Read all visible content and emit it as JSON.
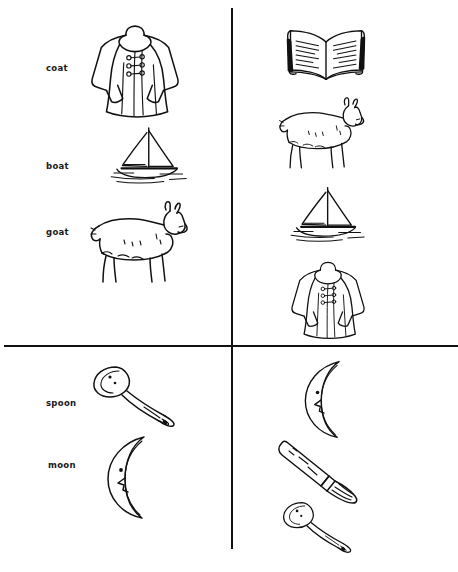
{
  "worksheet": {
    "title": "Rhyming / matching picture worksheet",
    "layout": "four-quadrant grid divided by one vertical and one horizontal rule",
    "ink_color": "#111111",
    "paper_color": "#ffffff"
  },
  "dividers": [
    {
      "name": "vertical-divider",
      "orientation": "vertical"
    },
    {
      "name": "horizontal-divider",
      "orientation": "horizontal"
    }
  ],
  "quadrants": {
    "top_left": {
      "name": "top-left-quadrant",
      "has_labels": true,
      "labels": [
        {
          "text": "coat",
          "x": 46,
          "y": 63
        },
        {
          "text": "boat",
          "x": 46,
          "y": 161
        },
        {
          "text": "goat",
          "x": 46,
          "y": 227
        }
      ],
      "pictures": [
        {
          "icon": "coat-icon",
          "name": "coat",
          "x": 84,
          "y": 22,
          "w": 102,
          "h": 98
        },
        {
          "icon": "sailboat-icon",
          "name": "boat",
          "x": 101,
          "y": 126,
          "w": 88,
          "h": 62
        },
        {
          "icon": "goat-icon",
          "name": "goat",
          "x": 80,
          "y": 196,
          "w": 110,
          "h": 90
        }
      ]
    },
    "top_right": {
      "name": "top-right-quadrant",
      "has_labels": false,
      "labels": [],
      "pictures": [
        {
          "icon": "open-book-icon",
          "name": "book",
          "x": 283,
          "y": 26,
          "w": 86,
          "h": 58
        },
        {
          "icon": "goat-icon",
          "name": "goat",
          "x": 270,
          "y": 92,
          "w": 96,
          "h": 80
        },
        {
          "icon": "sailboat-icon",
          "name": "boat",
          "x": 282,
          "y": 185,
          "w": 84,
          "h": 62
        },
        {
          "icon": "coat-icon",
          "name": "coat",
          "x": 281,
          "y": 259,
          "w": 94,
          "h": 82
        }
      ]
    },
    "bottom_left": {
      "name": "bottom-left-quadrant",
      "has_labels": true,
      "labels": [
        {
          "text": "spoon",
          "x": 46,
          "y": 398
        },
        {
          "text": "moon",
          "x": 48,
          "y": 460
        }
      ],
      "pictures": [
        {
          "icon": "spoon-icon",
          "name": "spoon",
          "x": 86,
          "y": 362,
          "w": 98,
          "h": 66
        },
        {
          "icon": "crescent-moon-icon",
          "name": "moon",
          "x": 98,
          "y": 432,
          "w": 62,
          "h": 90
        }
      ]
    },
    "bottom_right": {
      "name": "bottom-right-quadrant",
      "has_labels": false,
      "labels": [],
      "pictures": [
        {
          "icon": "crescent-moon-icon",
          "name": "moon",
          "x": 296,
          "y": 356,
          "w": 58,
          "h": 86
        },
        {
          "icon": "knife-icon",
          "name": "knife",
          "x": 275,
          "y": 434,
          "w": 86,
          "h": 72
        },
        {
          "icon": "spoon-icon",
          "name": "spoon",
          "x": 277,
          "y": 495,
          "w": 82,
          "h": 62
        }
      ]
    }
  },
  "vocabulary": [
    "coat",
    "boat",
    "goat",
    "spoon",
    "moon"
  ],
  "icons_used": [
    "coat-icon",
    "sailboat-icon",
    "goat-icon",
    "open-book-icon",
    "spoon-icon",
    "crescent-moon-icon",
    "knife-icon"
  ]
}
